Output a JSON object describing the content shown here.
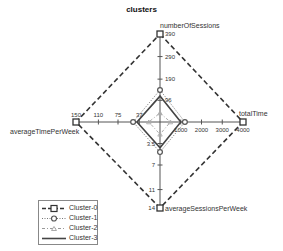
{
  "chart_data": {
    "type": "radar",
    "title": "clusters",
    "axes": [
      {
        "name": "numberOfSessions",
        "max": 390,
        "ticks": [
          96,
          190,
          290,
          390
        ],
        "direction": "up"
      },
      {
        "name": "totalTime",
        "max": 4000,
        "ticks": [
          1000,
          2000,
          3000,
          4000
        ],
        "direction": "right"
      },
      {
        "name": "averageSessionsPerWeek",
        "max": 14,
        "ticks": [
          3.5,
          7,
          11,
          14
        ],
        "direction": "down"
      },
      {
        "name": "averageTimePerWeek",
        "max": 150,
        "ticks": [
          37,
          75,
          110,
          150
        ],
        "direction": "left"
      }
    ],
    "series": [
      {
        "name": "Cluster-0",
        "style": "dashed",
        "marker": "square",
        "values": [
          390,
          4000,
          14,
          150
        ]
      },
      {
        "name": "Cluster-1",
        "style": "dotted",
        "marker": "circle",
        "values": [
          142,
          1200,
          4.9,
          48
        ]
      },
      {
        "name": "Cluster-2",
        "style": "dashdot",
        "marker": "triangle",
        "values": [
          40,
          500,
          2,
          20
        ]
      },
      {
        "name": "Cluster-3",
        "style": "solid",
        "marker": "none",
        "values": [
          115,
          1000,
          4.2,
          41
        ]
      }
    ],
    "legend_position": "bottom-left",
    "grid": false
  },
  "labels": {
    "title": "clusters",
    "axis_top": "numberOfSessions",
    "axis_right": "totalTime",
    "axis_bottom": "averageSessionsPerWeek",
    "axis_left": "averageTimePerWeek",
    "ticks_top": [
      "96",
      "190",
      "290",
      "390"
    ],
    "ticks_right": [
      "1000",
      "2000",
      "3000",
      "4000"
    ],
    "ticks_bottom": [
      "3.5",
      "7",
      "11",
      "14"
    ],
    "ticks_left": [
      "37",
      "75",
      "110",
      "150"
    ]
  },
  "legend": {
    "items": [
      "Cluster-0",
      "Cluster-1",
      "Cluster-2",
      "Cluster-3"
    ]
  },
  "colors": {
    "series_stroke": "#333333",
    "axis": "#555555",
    "text": "#333333",
    "light_series": "#999999"
  }
}
